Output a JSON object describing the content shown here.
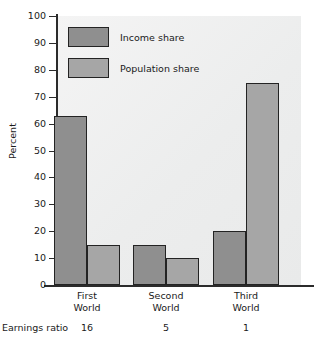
{
  "chart_data": {
    "type": "bar",
    "title": "",
    "subtitle": "",
    "xlabel": "",
    "ylabel": "Percent",
    "ylim": [
      0,
      100
    ],
    "yticks": [
      0,
      10,
      20,
      30,
      40,
      50,
      60,
      70,
      80,
      90,
      100
    ],
    "grid": false,
    "legend_position": "top-left inside plot",
    "categories": [
      "First World",
      "Second World",
      "Third World"
    ],
    "category_lines": [
      {
        "line1": "First",
        "line2": "World"
      },
      {
        "line1": "Second",
        "line2": "World"
      },
      {
        "line1": "Third",
        "line2": "World"
      }
    ],
    "series": [
      {
        "name": "Income share",
        "color": "#8f8f8f",
        "values": [
          63,
          15,
          20
        ]
      },
      {
        "name": "Population share",
        "color": "#a6a6a6",
        "values": [
          15,
          10,
          75
        ]
      }
    ],
    "annotations": {
      "earnings_ratio_label": "Earnings ratio",
      "earnings_ratio_values": [
        "16",
        "5",
        "1"
      ]
    }
  },
  "colors": {
    "income": "#8f8f8f",
    "population": "#a6a6a6",
    "bar_outline": "#232323",
    "axis": "#2b2b2b",
    "plot_background": "#eceded",
    "page_background": "#ffffff",
    "text": "#1a1a1a"
  }
}
